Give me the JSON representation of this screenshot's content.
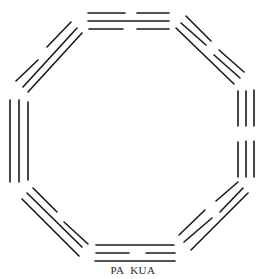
{
  "caption": "PA KUA",
  "colors": {
    "line": "#1a1a1a",
    "background": "#ffffff",
    "text": "#2a2a2a"
  },
  "trigrams": [
    {
      "position": "top",
      "lines": [
        "broken",
        "solid",
        "broken"
      ],
      "segments": [
        [
          88,
          13,
          125,
          13
        ],
        [
          137,
          13,
          169,
          13
        ],
        [
          88,
          21,
          169,
          21
        ],
        [
          89,
          29,
          123,
          29
        ],
        [
          137,
          29,
          169,
          29
        ]
      ]
    },
    {
      "position": "top-right",
      "lines": [
        "broken",
        "broken",
        "solid"
      ],
      "segments": [
        [
          186,
          16,
          211,
          41
        ],
        [
          219,
          50,
          244,
          72
        ],
        [
          181,
          23,
          206,
          45
        ],
        [
          214,
          55,
          240,
          78
        ],
        [
          176,
          28,
          234,
          84
        ]
      ]
    },
    {
      "position": "right",
      "lines": [
        "broken",
        "broken",
        "broken"
      ],
      "segments": [
        [
          254,
          90,
          254,
          126
        ],
        [
          254,
          141,
          254,
          177
        ],
        [
          246,
          91,
          246,
          126
        ],
        [
          246,
          141,
          246,
          177
        ],
        [
          238,
          91,
          238,
          126
        ],
        [
          238,
          142,
          238,
          177
        ]
      ]
    },
    {
      "position": "bottom-right",
      "lines": [
        "solid",
        "broken",
        "broken"
      ],
      "segments": [
        [
          191,
          250,
          248,
          193
        ],
        [
          184,
          242,
          212,
          218
        ],
        [
          220,
          212,
          243,
          188
        ],
        [
          179,
          235,
          205,
          210
        ],
        [
          216,
          201,
          238,
          182
        ]
      ]
    },
    {
      "position": "bottom",
      "lines": [
        "solid",
        "broken",
        "solid"
      ],
      "segments": [
        [
          96,
          245,
          174,
          245
        ],
        [
          96,
          253,
          129,
          253
        ],
        [
          146,
          253,
          175,
          253
        ],
        [
          95,
          261,
          175,
          261
        ]
      ]
    },
    {
      "position": "bottom-left",
      "lines": [
        "solid",
        "solid",
        "broken"
      ],
      "segments": [
        [
          22,
          199,
          79,
          256
        ],
        [
          27,
          193,
          82,
          247
        ],
        [
          33,
          188,
          57,
          212
        ],
        [
          64,
          222,
          88,
          244
        ]
      ]
    },
    {
      "position": "left",
      "lines": [
        "solid",
        "solid",
        "solid"
      ],
      "segments": [
        [
          10,
          100,
          10,
          182
        ],
        [
          19,
          100,
          19,
          182
        ],
        [
          28,
          102,
          28,
          180
        ]
      ]
    },
    {
      "position": "top-left",
      "lines": [
        "broken",
        "solid",
        "solid"
      ],
      "segments": [
        [
          16,
          81,
          38,
          60
        ],
        [
          47,
          47,
          71,
          22
        ],
        [
          23,
          87,
          77,
          28
        ],
        [
          28,
          92,
          82,
          33
        ]
      ]
    }
  ]
}
